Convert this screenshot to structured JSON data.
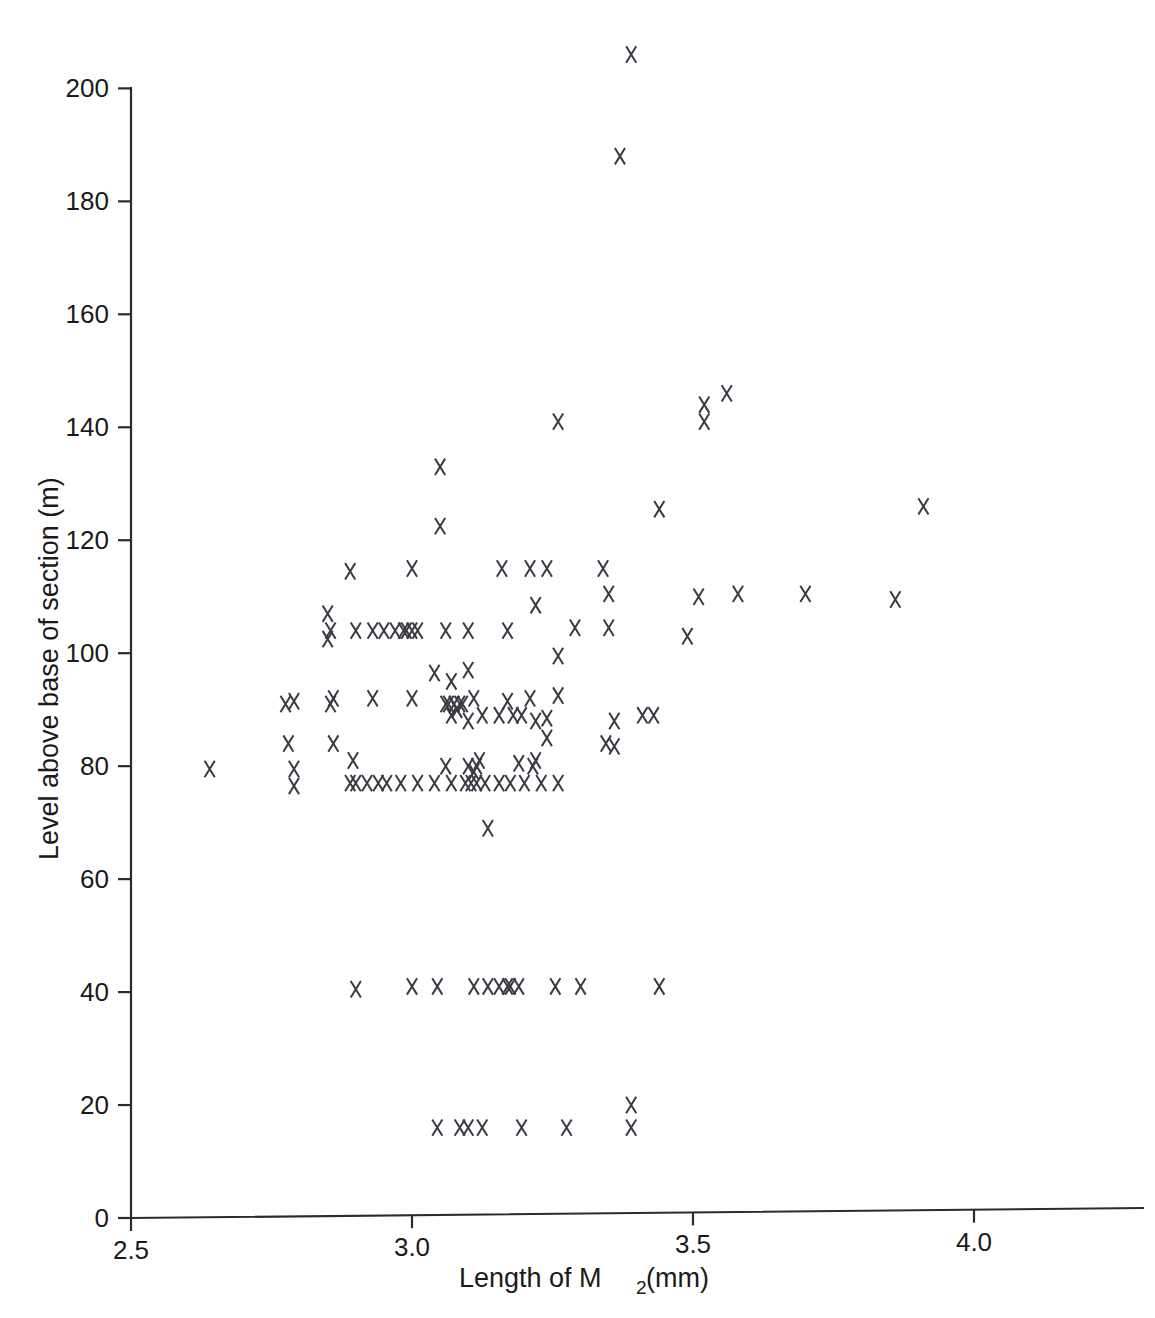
{
  "chart_data": {
    "type": "scatter",
    "title": "",
    "xlabel": "Length of M2 (mm)",
    "xlabel_main": "Length of M",
    "xlabel_sub": "2",
    "xlabel_tail": " (mm)",
    "ylabel": "Level above base of section (m)",
    "xlim": [
      2.5,
      4.22
    ],
    "ylim": [
      0,
      205
    ],
    "xticks": [
      2.5,
      3.0,
      3.5,
      4.0
    ],
    "xticklabels": [
      "2.5",
      "3.0",
      "3.5",
      "4.0"
    ],
    "yticks": [
      0,
      20,
      40,
      60,
      80,
      100,
      120,
      140,
      160,
      180,
      200
    ],
    "yticklabels": [
      "0",
      "20",
      "40",
      "60",
      "80",
      "100",
      "120",
      "140",
      "160",
      "180",
      "200"
    ],
    "grid": false,
    "legend": false,
    "marker": "x",
    "marker_color": "#3a3a44",
    "points": [
      [
        3.39,
        206
      ],
      [
        3.37,
        188
      ],
      [
        3.56,
        146
      ],
      [
        3.52,
        144
      ],
      [
        3.52,
        141
      ],
      [
        3.26,
        141
      ],
      [
        3.05,
        133
      ],
      [
        3.91,
        126
      ],
      [
        3.44,
        125.5
      ],
      [
        3.05,
        122.5
      ],
      [
        3.34,
        115
      ],
      [
        3.24,
        115
      ],
      [
        3.21,
        115
      ],
      [
        3.16,
        115
      ],
      [
        3.0,
        115
      ],
      [
        2.89,
        114.5
      ],
      [
        3.35,
        110.5
      ],
      [
        3.7,
        110.5
      ],
      [
        3.58,
        110.5
      ],
      [
        3.51,
        110
      ],
      [
        3.86,
        109.5
      ],
      [
        3.22,
        108.5
      ],
      [
        2.85,
        107
      ],
      [
        3.49,
        103
      ],
      [
        3.35,
        104.5
      ],
      [
        3.29,
        104.5
      ],
      [
        3.17,
        104
      ],
      [
        3.1,
        104
      ],
      [
        3.06,
        104
      ],
      [
        3.01,
        104
      ],
      [
        3.0,
        104
      ],
      [
        2.99,
        104
      ],
      [
        2.985,
        104
      ],
      [
        2.97,
        104
      ],
      [
        2.95,
        104
      ],
      [
        2.93,
        104
      ],
      [
        2.9,
        104
      ],
      [
        2.855,
        104
      ],
      [
        2.85,
        102.5
      ],
      [
        3.26,
        99.5
      ],
      [
        3.1,
        97
      ],
      [
        3.04,
        96.5
      ],
      [
        3.07,
        95
      ],
      [
        3.26,
        92.5
      ],
      [
        3.21,
        92
      ],
      [
        3.17,
        91.5
      ],
      [
        3.11,
        92
      ],
      [
        3.085,
        91
      ],
      [
        3.075,
        91
      ],
      [
        3.065,
        91
      ],
      [
        3.06,
        91
      ],
      [
        3.0,
        92
      ],
      [
        2.93,
        92
      ],
      [
        2.86,
        92
      ],
      [
        2.855,
        91
      ],
      [
        2.79,
        91.5
      ],
      [
        2.775,
        91
      ],
      [
        3.41,
        89
      ],
      [
        3.43,
        89
      ],
      [
        3.24,
        88.5
      ],
      [
        3.22,
        88
      ],
      [
        3.36,
        88
      ],
      [
        3.195,
        89
      ],
      [
        3.18,
        89
      ],
      [
        3.155,
        89
      ],
      [
        3.125,
        89
      ],
      [
        3.1,
        88
      ],
      [
        3.09,
        91
      ],
      [
        3.08,
        90
      ],
      [
        3.07,
        89
      ],
      [
        3.24,
        85
      ],
      [
        3.345,
        84
      ],
      [
        3.36,
        83.5
      ],
      [
        2.86,
        84
      ],
      [
        2.78,
        84
      ],
      [
        2.64,
        79.5
      ],
      [
        3.22,
        81
      ],
      [
        3.215,
        80
      ],
      [
        3.19,
        80.5
      ],
      [
        3.12,
        81
      ],
      [
        3.115,
        80
      ],
      [
        3.11,
        79
      ],
      [
        3.1,
        80
      ],
      [
        3.06,
        80
      ],
      [
        2.895,
        81
      ],
      [
        2.79,
        79.5
      ],
      [
        3.26,
        77
      ],
      [
        3.23,
        77
      ],
      [
        3.2,
        77
      ],
      [
        3.175,
        77
      ],
      [
        3.155,
        77
      ],
      [
        3.13,
        77
      ],
      [
        3.115,
        77
      ],
      [
        3.105,
        77
      ],
      [
        3.095,
        77
      ],
      [
        3.07,
        77
      ],
      [
        3.04,
        77
      ],
      [
        3.01,
        77
      ],
      [
        2.98,
        77
      ],
      [
        2.955,
        77
      ],
      [
        2.94,
        77
      ],
      [
        2.92,
        77
      ],
      [
        2.9,
        77
      ],
      [
        2.89,
        77
      ],
      [
        2.79,
        76.5
      ],
      [
        3.135,
        69
      ],
      [
        3.44,
        41
      ],
      [
        3.3,
        41
      ],
      [
        3.255,
        41
      ],
      [
        3.19,
        41
      ],
      [
        3.175,
        41
      ],
      [
        3.17,
        41
      ],
      [
        3.155,
        41
      ],
      [
        3.135,
        41
      ],
      [
        3.11,
        41
      ],
      [
        3.045,
        41
      ],
      [
        3.0,
        41
      ],
      [
        2.9,
        40.5
      ],
      [
        3.39,
        20
      ],
      [
        3.39,
        16
      ],
      [
        3.275,
        16
      ],
      [
        3.195,
        16
      ],
      [
        3.125,
        16
      ],
      [
        3.1,
        16
      ],
      [
        3.085,
        16
      ],
      [
        3.045,
        16
      ]
    ]
  },
  "axes": {
    "x_axis_name": "x-axis",
    "y_axis_name": "y-axis"
  }
}
